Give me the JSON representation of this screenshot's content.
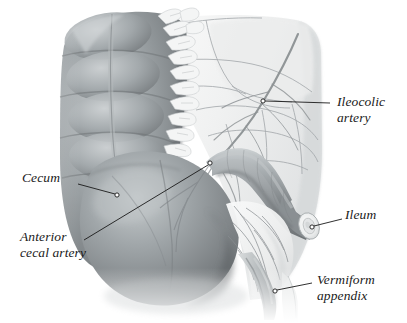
{
  "figure": {
    "kind": "anatomical-illustration",
    "style": "grayscale pencil / airbrush medical illustration",
    "background_color": "#ffffff",
    "ink_color": "#1a1a1a",
    "palette": {
      "colon_dark": "#6e7376",
      "colon_mid": "#9aa0a3",
      "colon_light": "#c3c8ca",
      "mesentery_light": "#f2f3f3",
      "mesentery_shade": "#dcdedf",
      "vessel_line": "#8d9295",
      "ileum_mid": "#9ea3a6",
      "ileum_dark": "#757a7d"
    }
  },
  "labels": [
    {
      "id": "ileocolic-artery",
      "line1": "Ileocolic",
      "line2": "artery",
      "text_x": 337,
      "text_y": 94,
      "align": "left",
      "leader": {
        "x1": 330,
        "y1": 103,
        "x2": 265,
        "y2": 101
      },
      "dot": {
        "cx": 263,
        "cy": 101,
        "r": 2.1
      }
    },
    {
      "id": "cecum",
      "line1": "Cecum",
      "line2": "",
      "text_x": 22,
      "text_y": 170,
      "align": "left",
      "leader": {
        "x1": 78,
        "y1": 184,
        "x2": 115,
        "y2": 194
      },
      "dot": {
        "cx": 117,
        "cy": 195,
        "r": 2.1
      }
    },
    {
      "id": "anterior-cecal-artery",
      "line1": "Anterior",
      "line2": "cecal artery",
      "text_x": 20,
      "text_y": 229,
      "align": "left",
      "leader": {
        "x1": 84,
        "y1": 240,
        "x2": 208,
        "y2": 165
      },
      "dot": {
        "cx": 210,
        "cy": 163,
        "r": 2.1
      }
    },
    {
      "id": "ileum",
      "line1": "Ileum",
      "line2": "",
      "text_x": 345,
      "text_y": 207,
      "align": "left",
      "leader": {
        "x1": 342,
        "y1": 219,
        "x2": 314,
        "y2": 226
      },
      "dot": {
        "cx": 312,
        "cy": 227,
        "r": 2.1
      }
    },
    {
      "id": "vermiform-appendix",
      "line1": "Vermiform",
      "line2": "appendix",
      "text_x": 317,
      "text_y": 272,
      "align": "left",
      "leader": {
        "x1": 312,
        "y1": 283,
        "x2": 277,
        "y2": 290
      },
      "dot": {
        "cx": 275,
        "cy": 291,
        "r": 2.1
      }
    }
  ],
  "structures": [
    {
      "id": "ascending-colon",
      "name": "Ascending colon with haustra"
    },
    {
      "id": "tenia-coli",
      "name": "Tenia coli"
    },
    {
      "id": "epiploic-appendages",
      "name": "Epiploic appendages"
    },
    {
      "id": "cecum-body",
      "name": "Cecum"
    },
    {
      "id": "mesentery",
      "name": "Mesentery"
    },
    {
      "id": "ileocolic-artery-vessel",
      "name": "Ileocolic artery"
    },
    {
      "id": "ileum-tube",
      "name": "Ileum (cut)"
    },
    {
      "id": "mesoappendix",
      "name": "Mesoappendix with appendicular vessels"
    },
    {
      "id": "appendix-body",
      "name": "Vermiform appendix"
    }
  ]
}
